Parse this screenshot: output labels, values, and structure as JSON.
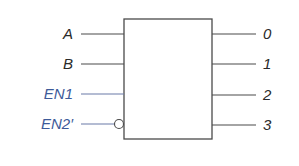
{
  "diagram": {
    "type": "decoder-block",
    "inputs": [
      {
        "label": "A",
        "color": "#2a2a2a",
        "active_low": false
      },
      {
        "label": "B",
        "color": "#2a2a2a",
        "active_low": false
      },
      {
        "label": "EN1",
        "color": "#3d5a99",
        "active_low": false
      },
      {
        "label": "EN2′",
        "color": "#3d5a99",
        "active_low": true
      }
    ],
    "outputs": [
      {
        "label": "0"
      },
      {
        "label": "1"
      },
      {
        "label": "2"
      },
      {
        "label": "3"
      }
    ],
    "colors": {
      "line": "#4a4a4a",
      "enable": "#3d5a99"
    }
  }
}
